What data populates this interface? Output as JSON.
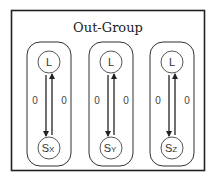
{
  "diagram": {
    "title": "Out-Group",
    "groups": [
      {
        "top_node": {
          "label": "L"
        },
        "bottom_node": {
          "label": "S",
          "subscript": "X"
        },
        "down_edge_label": "0",
        "up_edge_label": "0"
      },
      {
        "top_node": {
          "label": "L"
        },
        "bottom_node": {
          "label": "S",
          "subscript": "Y"
        },
        "down_edge_label": "0",
        "up_edge_label": "0"
      },
      {
        "top_node": {
          "label": "L"
        },
        "bottom_node": {
          "label": "S",
          "subscript": "Z"
        },
        "down_edge_label": "0",
        "up_edge_label": "0"
      }
    ]
  }
}
